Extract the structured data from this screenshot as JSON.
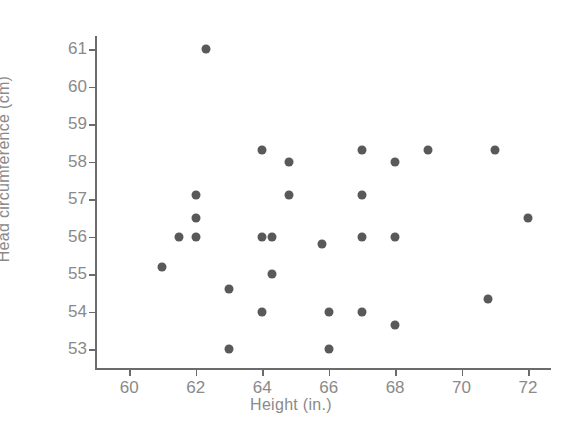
{
  "chart_data": {
    "type": "scatter",
    "title": "",
    "xlabel": "Height (in.)",
    "ylabel": "Head circumference (cm)",
    "xlim": [
      59.0,
      72.6
    ],
    "ylim": [
      52.5,
      61.35
    ],
    "xticks": [
      60,
      62,
      64,
      66,
      68,
      70,
      72
    ],
    "yticks": [
      53,
      54,
      55,
      56,
      57,
      58,
      59,
      60,
      61
    ],
    "xtick_labels": [
      "60",
      "62",
      "64",
      "66",
      "68",
      "70",
      "72"
    ],
    "ytick_labels": [
      "53",
      "54",
      "55",
      "56",
      "57",
      "58",
      "59",
      "60",
      "61"
    ],
    "grid": false,
    "legend": null,
    "marker_color": "#595959",
    "axis_color": "#6b6b6b",
    "text_color": "#8a8a8a",
    "background_color": "#ffffff",
    "n_points": 27,
    "points": [
      {
        "x": 61.0,
        "y": 55.2
      },
      {
        "x": 61.5,
        "y": 56.0
      },
      {
        "x": 62.0,
        "y": 57.1
      },
      {
        "x": 62.0,
        "y": 56.5
      },
      {
        "x": 62.0,
        "y": 56.0
      },
      {
        "x": 62.3,
        "y": 61.0
      },
      {
        "x": 63.0,
        "y": 54.6
      },
      {
        "x": 63.0,
        "y": 53.0
      },
      {
        "x": 64.0,
        "y": 58.3
      },
      {
        "x": 64.0,
        "y": 56.0
      },
      {
        "x": 64.0,
        "y": 54.0
      },
      {
        "x": 64.3,
        "y": 56.0
      },
      {
        "x": 64.3,
        "y": 55.0
      },
      {
        "x": 64.8,
        "y": 58.0
      },
      {
        "x": 64.8,
        "y": 57.1
      },
      {
        "x": 65.8,
        "y": 55.8
      },
      {
        "x": 66.0,
        "y": 54.0
      },
      {
        "x": 66.0,
        "y": 53.0
      },
      {
        "x": 67.0,
        "y": 58.3
      },
      {
        "x": 67.0,
        "y": 57.1
      },
      {
        "x": 67.0,
        "y": 56.0
      },
      {
        "x": 67.0,
        "y": 54.0
      },
      {
        "x": 68.0,
        "y": 58.0
      },
      {
        "x": 68.0,
        "y": 56.0
      },
      {
        "x": 68.0,
        "y": 53.65
      },
      {
        "x": 69.0,
        "y": 58.3
      },
      {
        "x": 70.8,
        "y": 54.35
      },
      {
        "x": 71.0,
        "y": 58.3
      },
      {
        "x": 72.0,
        "y": 56.5
      }
    ]
  }
}
